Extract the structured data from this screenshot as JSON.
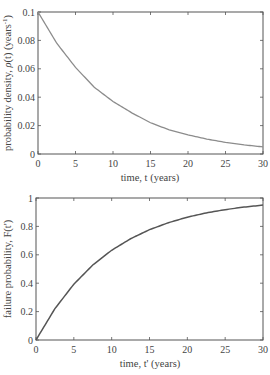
{
  "chart_data": [
    {
      "type": "line",
      "title": "",
      "xlabel": "time, t (years)",
      "ylabel": "probability density, ρ(t) (years⁻¹)",
      "ylabel_parts": {
        "main": "probability density, ",
        "sym": "ρ",
        "rest": "(t) (years",
        "sup": "-1",
        "close": ")"
      },
      "xlim": [
        0,
        30
      ],
      "ylim": [
        0,
        0.1
      ],
      "xticks": [
        0,
        5,
        10,
        15,
        20,
        25,
        30
      ],
      "yticks": [
        0,
        0.02,
        0.04,
        0.06,
        0.08,
        0.1
      ],
      "xtick_labels": [
        "0",
        "5",
        "10",
        "15",
        "20",
        "25",
        "30"
      ],
      "ytick_labels": [
        "0",
        "0.02",
        "0.04",
        "0.06",
        "0.08",
        "0.1"
      ],
      "grid": false,
      "line_color": "#8c8c8c",
      "series": [
        {
          "name": "rho(t) = 0.1·exp(-0.1 t)",
          "x": [
            0,
            2.5,
            5,
            7.5,
            10,
            12.5,
            15,
            17.5,
            20,
            22.5,
            25,
            27.5,
            30
          ],
          "values": [
            0.1,
            0.078,
            0.061,
            0.047,
            0.037,
            0.029,
            0.022,
            0.017,
            0.0135,
            0.0105,
            0.0082,
            0.0064,
            0.005
          ]
        }
      ]
    },
    {
      "type": "line",
      "title": "",
      "xlabel": "time, t' (years)",
      "ylabel": "failure probability, F(t')",
      "xlim": [
        0,
        30
      ],
      "ylim": [
        0,
        1
      ],
      "xticks": [
        0,
        5,
        10,
        15,
        20,
        25,
        30
      ],
      "yticks": [
        0,
        0.2,
        0.4,
        0.6,
        0.8,
        1
      ],
      "xtick_labels": [
        "0",
        "5",
        "10",
        "15",
        "20",
        "25",
        "30"
      ],
      "ytick_labels": [
        "0",
        "0.2",
        "0.4",
        "0.6",
        "0.8",
        "1"
      ],
      "grid": false,
      "line_color": "#555555",
      "series": [
        {
          "name": "F(t') = 1 - exp(-0.1 t')",
          "x": [
            0,
            2.5,
            5,
            7.5,
            10,
            12.5,
            15,
            17.5,
            20,
            22.5,
            25,
            27.5,
            30
          ],
          "values": [
            0,
            0.221,
            0.393,
            0.528,
            0.632,
            0.713,
            0.777,
            0.826,
            0.865,
            0.895,
            0.918,
            0.936,
            0.95
          ]
        }
      ]
    }
  ]
}
